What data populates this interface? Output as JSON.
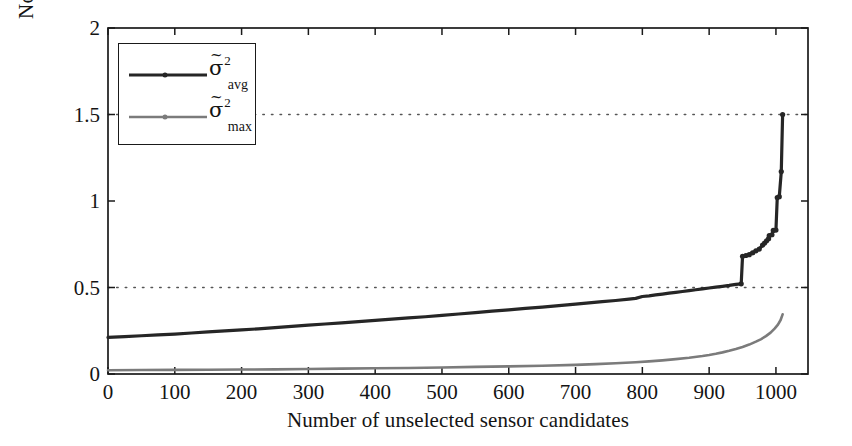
{
  "chart_data": {
    "type": "line",
    "title": "",
    "xlabel": "Number of unselected sensor candidates",
    "ylabel": "Normalised estimation errors",
    "xlim": [
      0,
      1048
    ],
    "ylim": [
      0,
      2
    ],
    "xticks": [
      0,
      100,
      200,
      300,
      400,
      500,
      600,
      700,
      800,
      900,
      1000
    ],
    "yticks": [
      0,
      0.5,
      1,
      1.5,
      2
    ],
    "grid": "horizontal-dotted at 0.5 and 1.5",
    "legend_position": "upper-left-inside",
    "series": [
      {
        "name": "sigma_tilde_sq_avg",
        "legend_main": "σ",
        "legend_tilde": "~",
        "legend_sup": "2",
        "legend_sub": "avg",
        "color": "#262626",
        "width": 3.2,
        "x": [
          0,
          25,
          50,
          75,
          100,
          125,
          150,
          175,
          200,
          225,
          250,
          275,
          300,
          325,
          350,
          375,
          400,
          425,
          450,
          475,
          500,
          525,
          550,
          575,
          600,
          625,
          650,
          675,
          700,
          720,
          740,
          760,
          780,
          790,
          800,
          810,
          820,
          830,
          840,
          850,
          860,
          870,
          880,
          890,
          900,
          910,
          920,
          930,
          940,
          948,
          950,
          955,
          960,
          965,
          970,
          975,
          980,
          983,
          986,
          989,
          990,
          994,
          996,
          1000,
          1002,
          1005,
          1008,
          1010
        ],
        "y": [
          0.212,
          0.216,
          0.221,
          0.226,
          0.231,
          0.237,
          0.243,
          0.249,
          0.255,
          0.261,
          0.268,
          0.275,
          0.282,
          0.289,
          0.296,
          0.303,
          0.31,
          0.317,
          0.324,
          0.331,
          0.339,
          0.347,
          0.355,
          0.363,
          0.371,
          0.379,
          0.387,
          0.395,
          0.404,
          0.411,
          0.418,
          0.425,
          0.433,
          0.437,
          0.448,
          0.452,
          0.457,
          0.462,
          0.467,
          0.472,
          0.477,
          0.482,
          0.487,
          0.492,
          0.497,
          0.502,
          0.507,
          0.512,
          0.518,
          0.521,
          0.68,
          0.685,
          0.69,
          0.7,
          0.712,
          0.722,
          0.745,
          0.757,
          0.77,
          0.782,
          0.8,
          0.805,
          0.83,
          0.832,
          1.02,
          1.025,
          1.17,
          1.5
        ]
      },
      {
        "name": "sigma_tilde_sq_max",
        "legend_main": "σ",
        "legend_tilde": "~",
        "legend_sup": "2",
        "legend_sub": "max",
        "color": "#7b7b7b",
        "width": 2.6,
        "x": [
          0,
          50,
          100,
          150,
          200,
          250,
          300,
          350,
          400,
          450,
          500,
          550,
          600,
          650,
          700,
          730,
          760,
          790,
          810,
          830,
          850,
          870,
          890,
          900,
          910,
          920,
          930,
          940,
          950,
          960,
          970,
          978,
          985,
          992,
          998,
          1003,
          1007,
          1010
        ],
        "y": [
          0.022,
          0.023,
          0.024,
          0.025,
          0.026,
          0.027,
          0.029,
          0.031,
          0.033,
          0.035,
          0.038,
          0.041,
          0.044,
          0.048,
          0.053,
          0.057,
          0.062,
          0.068,
          0.073,
          0.079,
          0.086,
          0.094,
          0.104,
          0.11,
          0.117,
          0.125,
          0.134,
          0.144,
          0.156,
          0.17,
          0.187,
          0.202,
          0.219,
          0.239,
          0.262,
          0.285,
          0.312,
          0.345
        ]
      }
    ]
  },
  "axes": {
    "ytick_labels": [
      "0",
      "0.5",
      "1",
      "1.5",
      "2"
    ],
    "xtick_labels": [
      "0",
      "100",
      "200",
      "300",
      "400",
      "500",
      "600",
      "700",
      "800",
      "900",
      "1000"
    ],
    "xlabel": "Number of unselected sensor candidates",
    "ylabel": "Normalised estimation errors"
  },
  "colors": {
    "avg": "#262626",
    "max": "#7b7b7b",
    "axis": "#1a1a1a",
    "grid": "#555555",
    "background": "#ffffff"
  }
}
